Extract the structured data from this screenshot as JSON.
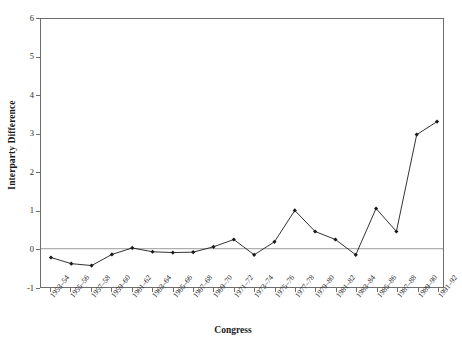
{
  "chart_data": {
    "type": "line",
    "title": "",
    "xlabel": "Congress",
    "ylabel": "Interparty Difference",
    "ylim": [
      -1,
      6
    ],
    "yticks": [
      -1,
      0,
      1,
      2,
      3,
      4,
      5,
      6
    ],
    "ytick_labels": [
      "-1",
      "0",
      "1",
      "2",
      "3",
      "4",
      "5",
      "6"
    ],
    "grid": false,
    "zero_line": true,
    "legend": "none",
    "marker": "filled-diamond",
    "line_color": "#1a1a1a",
    "frame_color": "#6d6d6d",
    "categories": [
      "1953-54",
      "1955-56",
      "1957-58",
      "1959-60",
      "1961-62",
      "1963-64",
      "1965-66",
      "1967-68",
      "1969-70",
      "1971-72",
      "1973-74",
      "1975-76",
      "1977-78",
      "1979-80",
      "1981-82",
      "1983-84",
      "1985-86",
      "1987-88",
      "1989-90",
      "1991-92"
    ],
    "values": [
      -0.23,
      -0.39,
      -0.44,
      -0.15,
      0.02,
      -0.08,
      -0.1,
      -0.09,
      0.05,
      0.24,
      -0.16,
      0.18,
      1.0,
      0.45,
      0.24,
      -0.16,
      1.05,
      0.45,
      2.98,
      3.32
    ],
    "series": [
      {
        "name": "Interparty Difference",
        "values": [
          -0.23,
          -0.39,
          -0.44,
          -0.15,
          0.02,
          -0.08,
          -0.1,
          -0.09,
          0.05,
          0.24,
          -0.16,
          0.18,
          1.0,
          0.45,
          0.24,
          -0.16,
          1.05,
          0.45,
          2.98,
          3.32
        ]
      }
    ]
  }
}
